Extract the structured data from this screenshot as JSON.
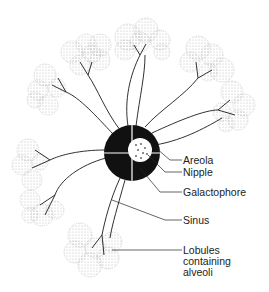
{
  "diagram": {
    "labels": [
      {
        "id": "areola",
        "text": "Areola"
      },
      {
        "id": "nipple",
        "text": "Nipple"
      },
      {
        "id": "galactophore",
        "text": "Galactophore"
      },
      {
        "id": "sinus",
        "text": "Sinus"
      },
      {
        "id": "lobules",
        "text": "Lobules containing alveoli",
        "lines": [
          "Lobules",
          "containing",
          "alveoli"
        ]
      }
    ],
    "colors": {
      "ink": "#1a1a1a",
      "lobule_stipple": "#9a9a9a",
      "background": "#ffffff"
    }
  }
}
